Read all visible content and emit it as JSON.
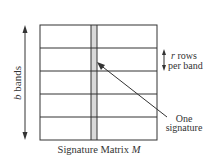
{
  "diagram": {
    "caption_prefix": "Signature Matrix ",
    "caption_var": "M",
    "left_label_var": "b",
    "left_label_text": " bands",
    "right_label_var": "r",
    "right_label_line1": " rows",
    "right_label_line2": "per band",
    "pointer_label_line1": "One",
    "pointer_label_line2": "signature",
    "num_bands": 5,
    "colors": {
      "line": "#333333",
      "highlight_column": "#d9d9d9",
      "background": "#ffffff"
    }
  }
}
